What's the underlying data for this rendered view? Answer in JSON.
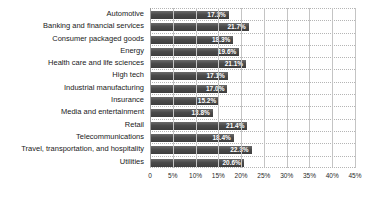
{
  "chart_data": {
    "type": "bar",
    "orientation": "horizontal",
    "title": "",
    "xlabel": "",
    "ylabel": "",
    "categories": [
      "Automotive",
      "Banking and financial services",
      "Consumer packaged goods",
      "Energy",
      "Health care and life sciences",
      "High tech",
      "Industrial manufacturing",
      "Insurance",
      "Media and entertainment",
      "Retail",
      "Telecommunications",
      "Travel, transportation, and hospitality",
      "Utilities"
    ],
    "values": [
      17.3,
      21.7,
      18.3,
      19.6,
      21.1,
      17.1,
      17.0,
      15.2,
      13.8,
      21.4,
      18.4,
      22.3,
      20.6
    ],
    "value_labels": [
      "17.3%",
      "21.7%",
      "18.3%",
      "19.6%",
      "21.1%",
      "17.1%",
      "17.0%",
      "15.2%",
      "13.8%",
      "21.4%",
      "18.4%",
      "22.3%",
      "20.6%"
    ],
    "xlim": [
      0,
      45
    ],
    "tick_values": [
      0,
      5,
      10,
      15,
      20,
      25,
      30,
      35,
      40,
      45
    ],
    "tick_labels": [
      "0",
      "5%",
      "10%",
      "15%",
      "20%",
      "25%",
      "30%",
      "35%",
      "40%",
      "45%"
    ],
    "grid": true,
    "legend": false,
    "colors": {
      "bar": "#4a4a4a",
      "bar_value_text": "#ffffff",
      "vertical_gridline": "#c4c4c4",
      "row_divider_dotted": "#b5b5b5",
      "category_text": "#1a1a1a",
      "tick_text": "#2a2a2a",
      "background": "#ffffff"
    }
  }
}
